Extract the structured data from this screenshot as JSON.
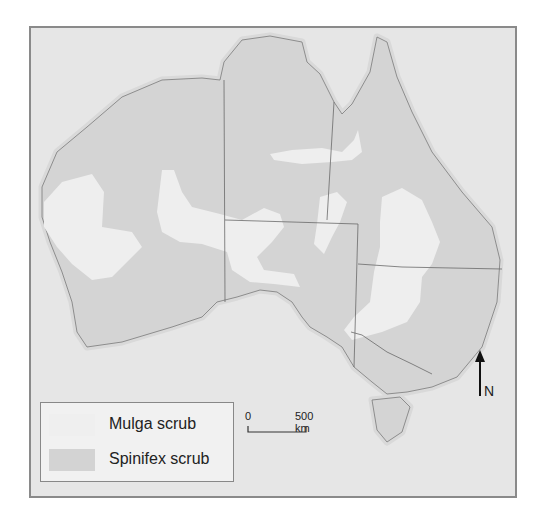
{
  "map": {
    "background_color": "#e6e6e6",
    "land_color": "#d6d6d6",
    "mulga_color": "#efefef",
    "spinifex_color": "#d6d6d6",
    "border_color": "#8a8a8a"
  },
  "legend": {
    "items": [
      {
        "label": "Mulga scrub",
        "color": "#efefef"
      },
      {
        "label": "Spinifex scrub",
        "color": "#d3d3d3"
      }
    ]
  },
  "scale_bar": {
    "start": "0",
    "end": "500 km"
  },
  "north_arrow": {
    "label": "N"
  }
}
